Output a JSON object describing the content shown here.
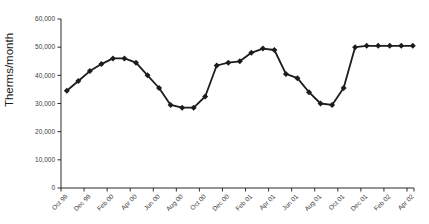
{
  "chart_data": {
    "type": "line",
    "title": "",
    "ylabel": "Therms/month",
    "xlabel": "",
    "categories": [
      "Oct 99",
      "Nov 99",
      "Dec 99",
      "Jan 00",
      "Feb 00",
      "Mar 00",
      "Apr 00",
      "May 00",
      "Jun 00",
      "Jul 00",
      "Aug 00",
      "Sep 00",
      "Oct 00",
      "Nov 00",
      "Dec 00",
      "Jan 01",
      "Feb 01",
      "Mar 01",
      "Apr 01",
      "May 01",
      "Jun 01",
      "Jul 01",
      "Aug 01",
      "Sep 01",
      "Oct 01",
      "Nov 01",
      "Dec 01",
      "Jan 02",
      "Feb 02",
      "Mar 02",
      "Apr 02"
    ],
    "values": [
      34500,
      38000,
      41500,
      44000,
      46000,
      46000,
      44500,
      40000,
      35500,
      29500,
      28500,
      28500,
      32500,
      43500,
      44500,
      45000,
      48000,
      49500,
      49000,
      40500,
      39000,
      34000,
      30000,
      29500,
      35500,
      50000,
      50500,
      50500,
      50500,
      50500,
      50500
    ],
    "x_tick_labels": [
      "Oct 99",
      "Dec 99",
      "Feb 00",
      "Apr 00",
      "Jun 00",
      "Aug 00",
      "Oct 00",
      "Dec 00",
      "Feb 01",
      "Apr 01",
      "Jun 01",
      "Aug 01",
      "Oct 01",
      "Dec 01",
      "Feb 02",
      "Apr 02"
    ],
    "x_tick_every": 2,
    "y_ticks": [
      0,
      10000,
      20000,
      30000,
      40000,
      50000,
      60000
    ],
    "y_tick_labels": [
      "0",
      "10,000",
      "20,000",
      "30,000",
      "40,000",
      "50,000",
      "60,000"
    ],
    "ylim": [
      0,
      60000
    ],
    "grid": false,
    "legend": "none",
    "marker": "diamond",
    "line_color": "#1c1c1c",
    "marker_color": "#1c1c1c",
    "axis_color": "#2a2a2a",
    "tick_label_color": "#3d3d3d",
    "ylabel_color": "#1c1c1c",
    "background": "#ffffff"
  }
}
